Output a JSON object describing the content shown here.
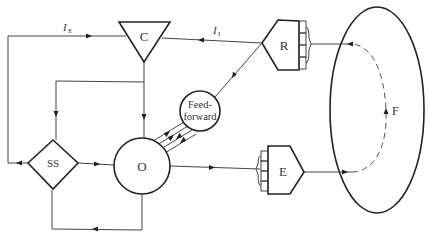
{
  "diagram": {
    "nodes": {
      "C": {
        "label": "C",
        "shape": "triangle-down"
      },
      "R": {
        "label": "R",
        "shape": "receptor-pentagon"
      },
      "E": {
        "label": "E",
        "shape": "effector-pentagon"
      },
      "SS": {
        "label": "SS",
        "shape": "diamond"
      },
      "O": {
        "label": "O",
        "shape": "circle"
      },
      "FF": {
        "label_line1": "Feed-",
        "label_line2": "forward",
        "shape": "circle"
      },
      "F": {
        "label": "F",
        "shape": "ellipse"
      }
    },
    "edge_labels": {
      "ie": {
        "main": "I",
        "sub": "E"
      },
      "ii": {
        "main": "I",
        "sub": "I"
      }
    },
    "edges": [
      {
        "from": "SS",
        "to": "C",
        "label": "I_E",
        "route": "left loop over top"
      },
      {
        "from": "R",
        "to": "C",
        "label": "I_I"
      },
      {
        "from": "R",
        "to": "FF"
      },
      {
        "from": "C",
        "to": "O"
      },
      {
        "from": "C",
        "to": "SS"
      },
      {
        "from": "SS",
        "to": "O"
      },
      {
        "from": "O",
        "to": "SS",
        "route": "bottom loop"
      },
      {
        "from": "O",
        "to": "FF",
        "multi": 4,
        "bidirectional": true
      },
      {
        "from": "O",
        "to": "E"
      },
      {
        "from": "E",
        "to": "F"
      },
      {
        "from": "F",
        "to": "R",
        "style": "dashed"
      }
    ],
    "colors": {
      "stroke": "#222222",
      "background": "#ffffff"
    }
  }
}
